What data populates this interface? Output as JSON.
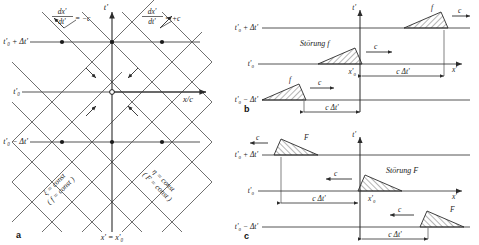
{
  "figure": {
    "background": "#ffffff",
    "line_color": "#3a3a3a",
    "axis_color": "#2b2b2b",
    "hatch_color": "#2b2b2b",
    "width": 479,
    "height": 245
  },
  "panel_a": {
    "letter": "a",
    "axis_vertical_label": "t'",
    "axis_horizontal_label": "x/c",
    "bottom_label": "x' = x'₀",
    "slope_left_label": "dx'",
    "slope_left_denom": "dt'",
    "slope_left_value": "= −c",
    "slope_right_label": "dx'",
    "slope_right_denom": "dt'",
    "slope_right_value": "= +c",
    "time_labels": [
      "t'₀ + Δt'",
      "t'₀",
      "t'₀ − Δt'"
    ],
    "char_left_line1": "ξ = const",
    "char_left_line2": "( f = const )",
    "char_right_line1": "η = const",
    "char_right_line2": "( F = const )"
  },
  "panel_b": {
    "letter": "b",
    "axis_vertical_label": "t'",
    "axis_horizontal_label": "x'",
    "disturbance_label": "Störung f",
    "origin_label": "x'₀",
    "time_labels": [
      "t'₀ + Δt'",
      "t'₀",
      "t'₀ − Δt'"
    ],
    "speed_labels": [
      "c",
      "c",
      "c"
    ],
    "pulse_labels": [
      "f",
      "f",
      "f"
    ],
    "distance_labels": [
      "c Δt'",
      "c Δt'"
    ],
    "direction": "right"
  },
  "panel_c": {
    "letter": "c",
    "axis_vertical_label": "t'",
    "axis_horizontal_label": "x'",
    "disturbance_label": "Störung F",
    "origin_label": "x'₀",
    "time_labels": [
      "t'₀ + Δt'",
      "t'₀",
      "t'₀ − Δt'"
    ],
    "speed_labels": [
      "c",
      "c",
      "c"
    ],
    "pulse_labels": [
      "F",
      "F",
      "F"
    ],
    "distance_labels": [
      "c Δt'",
      "c Δt'"
    ],
    "direction": "left"
  }
}
